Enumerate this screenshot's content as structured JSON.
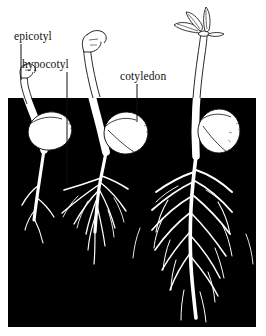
{
  "figure": {
    "background_color": "#ffffff",
    "soil_color": "#000000",
    "ink_color": "#111111",
    "plant_fill_color": "#ffffff"
  },
  "labels": [
    {
      "id": "epicotyl",
      "text": "epicotyl",
      "x": 14,
      "y": 40,
      "leader": {
        "from_x": 21,
        "from_y": 44,
        "to_x": 21,
        "to_y": 80
      }
    },
    {
      "id": "hypocotyl",
      "text": "hypocotyl",
      "x": 22,
      "y": 68,
      "leader": {
        "from_x": 67,
        "from_y": 72,
        "to_x": 67,
        "to_y": 186
      }
    },
    {
      "id": "cotyledon",
      "text": "cotyledon",
      "x": 120,
      "y": 80,
      "leader": {
        "from_x": 137,
        "from_y": 84,
        "to_x": 137,
        "to_y": 122
      }
    }
  ],
  "soil": {
    "name": "soil-region",
    "x": 8,
    "y": 98,
    "width": 248,
    "height": 229
  },
  "seedlings": [
    {
      "id": "stage-1",
      "stage_number": 1,
      "description": "early germination, hooked shoot just emerging above soil",
      "shoot_tip_x": 22,
      "shoot_tip_y": 76,
      "seed_center_x": 50,
      "seed_center_y": 131,
      "seed_rx": 22,
      "seed_ry": 19,
      "root_depth": 205
    },
    {
      "id": "stage-2",
      "stage_number": 2,
      "description": "elongated hypocotyl arch above soil, fibrous root system developing",
      "shoot_tip_x": 84,
      "shoot_tip_y": 50,
      "seed_center_x": 126,
      "seed_center_y": 133,
      "seed_rx": 22,
      "seed_ry": 21,
      "root_depth": 252
    },
    {
      "id": "stage-3",
      "stage_number": 3,
      "description": "upright stem with expanded leaves, extensive branched root system",
      "shoot_tip_x": 204,
      "shoot_tip_y": 10,
      "seed_center_x": 219,
      "seed_center_y": 131,
      "seed_rx": 21,
      "seed_ry": 22,
      "root_depth": 320
    }
  ]
}
